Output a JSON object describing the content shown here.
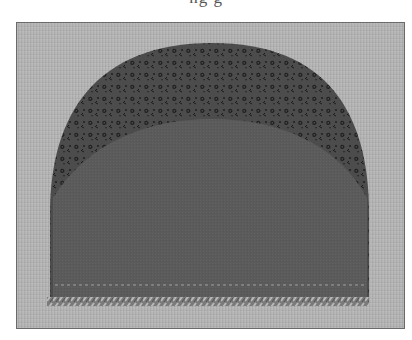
{
  "caption": {
    "text": "ng    g",
    "cropped": true
  },
  "photo": {
    "subject": "sewn fabric panel with rounded top",
    "background_color": "#b4b4b4",
    "frame_border_color": "#6a6a6a",
    "patterned_section": {
      "color": "#4a4a4a",
      "pattern_color": "#1e1e1e",
      "description": "small floral print"
    },
    "solid_section": {
      "color": "#5a5a5a"
    },
    "stitch_line_color": "#9a9a9a",
    "serged_edge_color": "#8c8c8c"
  }
}
